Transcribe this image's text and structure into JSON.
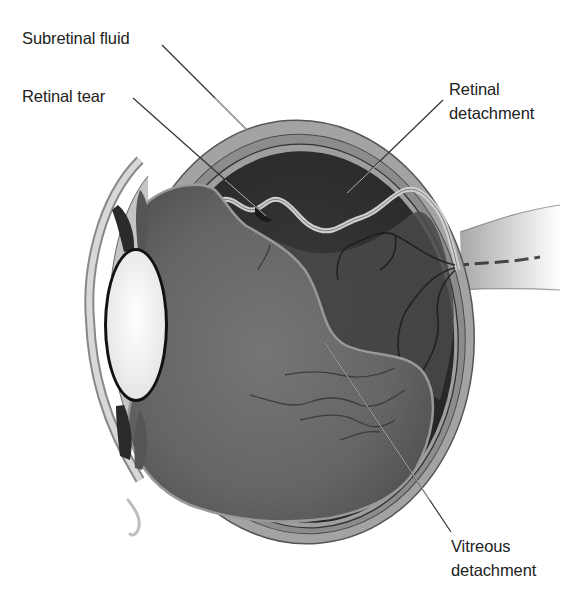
{
  "figure": {
    "style": "grayscale anatomical illustration",
    "colors": {
      "background": "#ffffff",
      "label_text": "#222222",
      "leader_line": "#333333",
      "sclera": "#9a9a9a",
      "subretinal_fluid": "#3a3a3a",
      "vitreous": "#6e6e6e",
      "lens": "#f4f4f4"
    }
  },
  "labels": {
    "subretinal_fluid": {
      "lines": [
        "Subretinal fluid"
      ]
    },
    "retinal_tear": {
      "lines": [
        "Retinal tear"
      ]
    },
    "retinal_detachment": {
      "lines": [
        "Retinal",
        "detachment"
      ]
    },
    "vitreous_detachment": {
      "lines": [
        "Vitreous",
        "detachment"
      ]
    }
  },
  "leaders": [
    {
      "target": "subretinal_fluid",
      "from": [
        162,
        45
      ],
      "to": [
        247,
        130
      ]
    },
    {
      "target": "retinal_tear",
      "from": [
        133,
        98
      ],
      "to": [
        266,
        216
      ]
    },
    {
      "target": "retinal_detachment",
      "from": [
        443,
        100
      ],
      "to": [
        347,
        193
      ]
    },
    {
      "target": "vitreous_detachment",
      "from": [
        325,
        343
      ],
      "to": [
        451,
        532
      ]
    }
  ]
}
